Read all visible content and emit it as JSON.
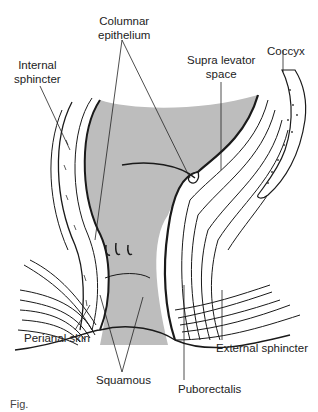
{
  "figure": {
    "type": "anatomical-diagram",
    "labels": {
      "columnar_epithelium": [
        "Columnar",
        "epithelium"
      ],
      "internal_sphincter": [
        "Internal",
        "sphincter"
      ],
      "supra_levator_space": [
        "Supra levator",
        "space"
      ],
      "coccyx": "Coccyx",
      "perianal_skin": "Perianal skin",
      "squamous": "Squamous",
      "puboretalis": "Puborectalis",
      "external_sphincter": "External sphincter"
    },
    "colors": {
      "mucosa_fill": "#bdbdbd",
      "line": "#1a1a1a",
      "background": "#ffffff"
    },
    "caption_partial": "Fig."
  }
}
